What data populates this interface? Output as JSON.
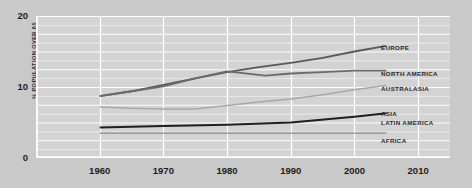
{
  "chart_data": {
    "type": "line",
    "title": "",
    "xlabel": "",
    "ylabel": "% POPULATION OVER 65",
    "xlim": [
      1950,
      2015
    ],
    "ylim": [
      0,
      20
    ],
    "grid": true,
    "legend_position": "right-inline",
    "x_ticks": [
      "1960",
      "1970",
      "1980",
      "1990",
      "2000",
      "2010"
    ],
    "y_ticks": [
      "0",
      "10",
      "20"
    ],
    "series": [
      {
        "name": "EUROPE",
        "color": "#595959",
        "width": 1.8,
        "x": [
          1960,
          1965,
          1970,
          1975,
          1980,
          1985,
          1990,
          1995,
          2000,
          2005
        ],
        "values": [
          8.7,
          9.4,
          10.3,
          11.2,
          12.1,
          12.8,
          13.4,
          14.1,
          15.0,
          15.8
        ]
      },
      {
        "name": "NORTH AMERICA",
        "color": "#6b6b6b",
        "width": 1.8,
        "x": [
          1960,
          1965,
          1970,
          1975,
          1980,
          1986,
          1990,
          1995,
          2000,
          2005
        ],
        "values": [
          8.7,
          9.4,
          10.1,
          11.2,
          12.2,
          11.6,
          11.9,
          12.1,
          12.3,
          12.3
        ]
      },
      {
        "name": "AUSTRALASIA",
        "color": "#a8a8a8",
        "width": 1.5,
        "x": [
          1960,
          1965,
          1970,
          1975,
          1980,
          1985,
          1990,
          1995,
          2000,
          2005
        ],
        "values": [
          7.2,
          7.0,
          6.9,
          6.9,
          7.4,
          7.9,
          8.3,
          8.9,
          9.6,
          10.2
        ]
      },
      {
        "name": "ASIA",
        "color": "#1f1f1f",
        "width": 2.0,
        "x": [
          1960,
          1970,
          1980,
          1990,
          2000,
          2005
        ],
        "values": [
          4.3,
          4.5,
          4.7,
          5.0,
          5.8,
          6.3
        ]
      },
      {
        "name": "LATIN AMERICA",
        "color": "#1f1f1f",
        "width": 0,
        "x": [],
        "values": []
      },
      {
        "name": "AFRICA",
        "color": "#8a8a8a",
        "width": 1.4,
        "x": [
          1960,
          1970,
          1980,
          1990,
          2000,
          2005
        ],
        "values": [
          3.5,
          3.5,
          3.5,
          3.5,
          3.5,
          3.5
        ]
      }
    ],
    "labels": [
      {
        "text": "EUROPE",
        "x": 381,
        "y": 45
      },
      {
        "text": "NORTH AMERICA",
        "x": 381,
        "y": 71
      },
      {
        "text": "AUSTRALASIA",
        "x": 381,
        "y": 86
      },
      {
        "text": "ASIA",
        "x": 381,
        "y": 111
      },
      {
        "text": "LATIN AMERICA",
        "x": 381,
        "y": 120
      },
      {
        "text": "AFRICA",
        "x": 381,
        "y": 138
      }
    ]
  }
}
